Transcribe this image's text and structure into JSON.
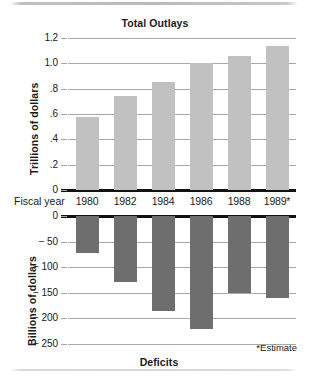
{
  "figure": {
    "estimate_note": "*Estimate",
    "category_axis_label": "Fiscal year",
    "colors": {
      "outlay_bar": "#c1c1c1",
      "deficit_bar": "#6e6e6e",
      "gridline": "#a8a8a8",
      "baseline": "#111111",
      "text": "#1a1a1a",
      "background": "#ffffff"
    }
  },
  "chart_data": [
    {
      "type": "bar",
      "id": "total-outlays",
      "title": "Total Outlays",
      "xlabel": "Fiscal year",
      "ylabel": "Trillions of dollars",
      "categories": [
        "1980",
        "1982",
        "1984",
        "1986",
        "1988",
        "1989*"
      ],
      "values": [
        0.58,
        0.74,
        0.85,
        1.0,
        1.06,
        1.14
      ],
      "ylim": [
        0,
        1.2
      ],
      "yticks": [
        0,
        0.2,
        0.4,
        0.6,
        0.8,
        1.0,
        1.2
      ],
      "ytick_labels": [
        "0",
        ".2",
        ".4",
        ".6",
        ".8",
        "1.0",
        "1.2"
      ],
      "grid": true,
      "legend": "none",
      "bar_color": "#c1c1c1"
    },
    {
      "type": "bar",
      "id": "deficits",
      "title": "Deficits",
      "xlabel": "Fiscal year",
      "ylabel": "Billions of dollars",
      "categories": [
        "1980",
        "1982",
        "1984",
        "1986",
        "1988",
        "1989*"
      ],
      "values": [
        -72,
        -128,
        -185,
        -221,
        -151,
        -160
      ],
      "ylim": [
        -250,
        0
      ],
      "yticks": [
        0,
        -50,
        -100,
        -150,
        -200,
        -250
      ],
      "ytick_labels": [
        "0",
        "− 50",
        "− 100",
        "− 150",
        "− 200",
        "− 250"
      ],
      "grid": true,
      "legend": "none",
      "bar_color": "#6e6e6e"
    }
  ]
}
